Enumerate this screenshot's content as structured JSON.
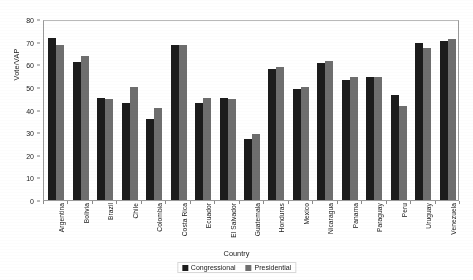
{
  "chart_data": {
    "type": "bar",
    "title": "",
    "xlabel": "Country",
    "ylabel": "Vote/VAP",
    "ylim": [
      0,
      80
    ],
    "ytick_step": 10,
    "yticks": [
      0,
      10,
      20,
      30,
      40,
      50,
      60,
      70,
      80
    ],
    "grid": false,
    "legend_position": "bottom-center",
    "categories": [
      "Argentina",
      "Bolivia",
      "Brazil",
      "Chile",
      "Colombia",
      "Costa Rica",
      "Ecuador",
      "El Salvador",
      "Guatemala",
      "Honduras",
      "Mexico",
      "Nicaragua",
      "Panama",
      "Paraguay",
      "Peru",
      "Uruguay",
      "Venezuela"
    ],
    "series": [
      {
        "name": "Congressional",
        "color": "#1c1c1c",
        "values": [
          71.5,
          61.0,
          45.0,
          43.0,
          36.0,
          68.5,
          43.0,
          45.0,
          27.0,
          58.0,
          49.0,
          60.5,
          53.0,
          54.5,
          46.5,
          69.5,
          70.5
        ]
      },
      {
        "name": "Presidential",
        "color": "#6e6e6e",
        "values": [
          68.5,
          63.5,
          44.5,
          50.0,
          40.5,
          68.5,
          45.0,
          44.5,
          29.0,
          59.0,
          50.0,
          61.5,
          54.5,
          54.5,
          41.5,
          67.0,
          71.0
        ]
      }
    ]
  },
  "legend": {
    "entries": [
      {
        "label": "Congressional"
      },
      {
        "label": "Presidential"
      }
    ]
  },
  "axes": {
    "y_title": "Vote/VAP",
    "x_title": "Country"
  }
}
